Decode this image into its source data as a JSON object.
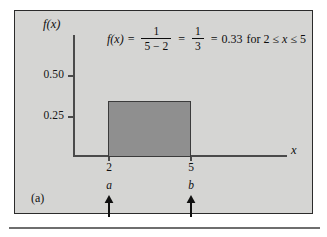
{
  "figure": {
    "panel_label": "(a)",
    "axis_label_y": "f(x)",
    "axis_label_x": "x",
    "equation": {
      "lhs": "f(x)",
      "eq1": "=",
      "frac1_num": "1",
      "frac1_den": "5 − 2",
      "eq2": "=",
      "frac2_num": "1",
      "frac2_den": "3",
      "eq3": "=",
      "value": "0.33",
      "condition": "for 2 ≤ x ≤ 5"
    },
    "y_ticks": [
      "0.50",
      "0.25"
    ],
    "x_values": [
      "2",
      "5"
    ],
    "x_symbols": [
      "a",
      "b"
    ],
    "arrow_icon_a": "up-arrow-icon",
    "arrow_icon_b": "up-arrow-icon"
  },
  "chart_data": {
    "type": "area",
    "title": "",
    "subtitle": "",
    "xlabel": "x",
    "ylabel": "f(x)",
    "xlim": [
      0,
      7.5
    ],
    "ylim": [
      0,
      0.72
    ],
    "grid": false,
    "legend": null,
    "x_tick_labels": [
      "2",
      "5"
    ],
    "x_tick_values": [
      2,
      5
    ],
    "y_tick_labels": [
      "0.50",
      "0.25"
    ],
    "y_tick_values": [
      0.5,
      0.25
    ],
    "series": [
      {
        "name": "uniform density",
        "kind": "rectangle",
        "x_start": 2,
        "x_end": 5,
        "height": 0.33,
        "fill_color": "#8f8f8f",
        "edge_color": "#3b3b3b"
      }
    ],
    "annotations": [
      {
        "text": "f(x) = 1/(5 − 2) = 1/3 = 0.33 for 2 ≤ x ≤ 5",
        "x": 4.0,
        "y": 0.66
      },
      {
        "text": "a",
        "x": 2,
        "y": -0.09
      },
      {
        "text": "b",
        "x": 5,
        "y": -0.09
      },
      {
        "text": "(a)",
        "x": 0.15,
        "y": -0.16
      }
    ],
    "colors": {
      "background": "#d5d5d3",
      "axis": "#4a4a4a",
      "rect_fill": "#8f8f8f",
      "rect_edge": "#3b3b3b",
      "text": "#101010"
    }
  }
}
